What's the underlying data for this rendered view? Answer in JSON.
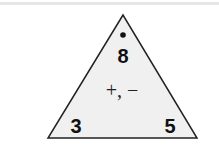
{
  "fact_family": {
    "top": "8",
    "bottom_left": "3",
    "bottom_right": "5",
    "operations": "+, −",
    "top_marker": "dot"
  },
  "colors": {
    "fill": "#f0f0f0",
    "stroke": "#222222",
    "text": "#111111"
  }
}
